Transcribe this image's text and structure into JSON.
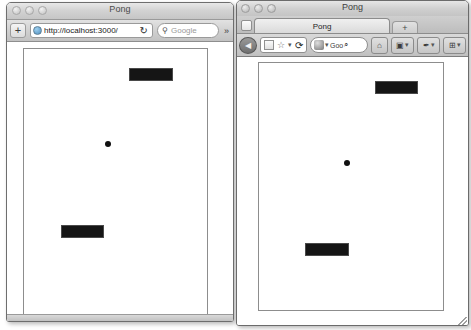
{
  "scene": {
    "description": "Two browser windows side by side both running a Pong game at localhost:3000"
  },
  "safari_window": {
    "title": "Pong",
    "traffic_lights": [
      "close",
      "minimize",
      "zoom"
    ],
    "toolbar": {
      "add_label": "+",
      "url_value": "http://localhost:3000/",
      "url_placeholder": "Enter address",
      "site_icon": "globe-icon",
      "reload_label": "↻",
      "search_icon": "magnifier-icon",
      "search_placeholder": "Google",
      "search_value": "",
      "overflow_label": "»"
    },
    "game": {
      "top_paddle": {
        "x": 105,
        "y": 19,
        "w": 44,
        "h": 13
      },
      "bottom_paddle": {
        "x": 37,
        "y": 176,
        "w": 43,
        "h": 13
      },
      "ball": {
        "x": 81,
        "y": 92,
        "size": 6
      }
    }
  },
  "firefox_window": {
    "title": "Pong",
    "traffic_lights": [
      "close",
      "minimize",
      "zoom"
    ],
    "tabs": [
      {
        "label": "Pong",
        "active": true
      }
    ],
    "new_tab_label": "+",
    "toolbar": {
      "back_label": "◀",
      "site_icon": "page-icon",
      "star_label": "☆",
      "dropdown_label": "▾",
      "reload_label": "⟳",
      "search_engine_icon": "search-engine-icon",
      "search_engine_dropdown": "▾",
      "search_value": "Goo",
      "search_magnifier": "⌕",
      "home_label": "⌂",
      "camera_label": "▣",
      "camera_dropdown": "▾",
      "pin_label": "✒",
      "pin_dropdown": "▾",
      "grid_label": "⊞",
      "grid_dropdown": "▾"
    },
    "game": {
      "top_paddle": {
        "x": 116,
        "y": 18,
        "w": 43,
        "h": 13
      },
      "bottom_paddle": {
        "x": 46,
        "y": 180,
        "w": 44,
        "h": 13
      },
      "ball": {
        "x": 85,
        "y": 97,
        "size": 6
      }
    }
  },
  "colors": {
    "paddle": "#151515",
    "ball": "#101010",
    "playfield_bg": "#ffffff",
    "playfield_border": "#8d8d8d",
    "chrome_gray": "#c8c8c8"
  }
}
